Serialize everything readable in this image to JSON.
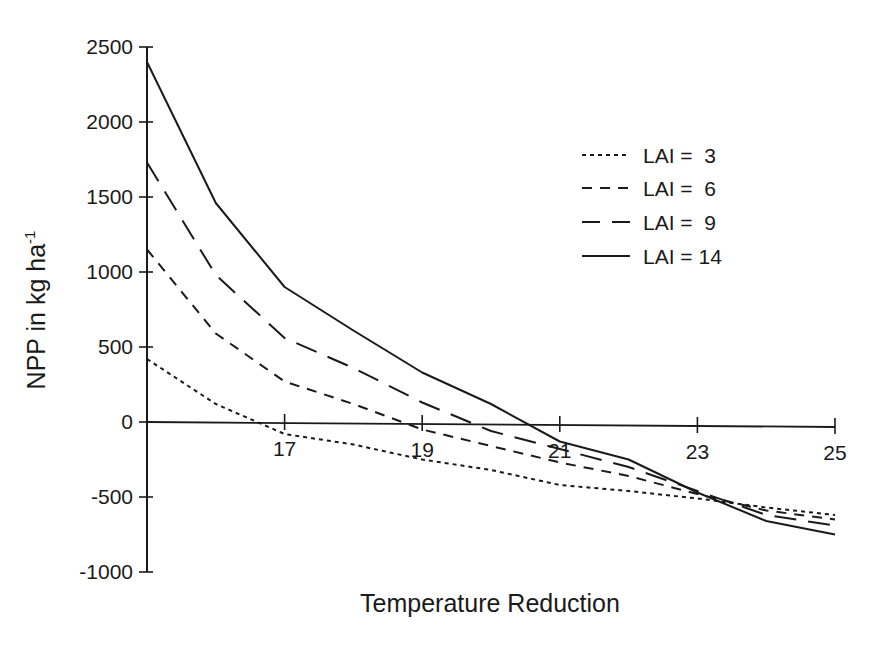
{
  "chart_data": {
    "type": "line",
    "title": "",
    "xlabel": "Temperature Reduction",
    "ylabel": "NPP in kg ha",
    "ylabel_superscript": "-1",
    "xlim": [
      15,
      25
    ],
    "ylim": [
      -1000,
      2500
    ],
    "x_ticks": [
      17,
      19,
      21,
      23,
      25
    ],
    "y_ticks": [
      2500,
      2000,
      1500,
      1000,
      500,
      0,
      -500,
      -1000
    ],
    "grid": false,
    "legend_position": "upper right",
    "x": [
      15,
      16,
      17,
      18,
      19,
      20,
      21,
      22,
      23,
      24,
      25
    ],
    "series": [
      {
        "name": "LAI =  3",
        "style": "dotted",
        "values": [
          420,
          120,
          -80,
          -150,
          -250,
          -320,
          -420,
          -460,
          -510,
          -570,
          -620
        ]
      },
      {
        "name": "LAI =  6",
        "style": "short-dash",
        "values": [
          1150,
          590,
          270,
          120,
          -50,
          -160,
          -270,
          -360,
          -480,
          -590,
          -650
        ]
      },
      {
        "name": "LAI =  9",
        "style": "long-dash",
        "values": [
          1730,
          980,
          560,
          360,
          130,
          -60,
          -180,
          -300,
          -460,
          -620,
          -690
        ]
      },
      {
        "name": "LAI = 14",
        "style": "solid",
        "values": [
          2400,
          1460,
          900,
          610,
          330,
          120,
          -130,
          -250,
          -470,
          -660,
          -750
        ]
      }
    ]
  },
  "colors": {
    "ink": "#1a1a1a",
    "background": "#ffffff"
  }
}
